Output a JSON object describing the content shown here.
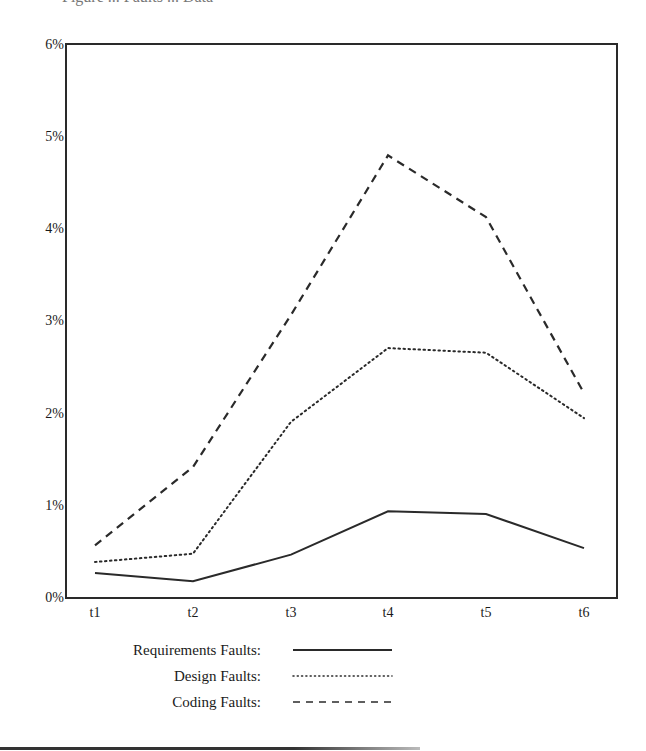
{
  "header": {
    "cutoff_title": "Figure ... Faults ... Data"
  },
  "chart_data": {
    "type": "line",
    "title": "",
    "xlabel": "",
    "ylabel": "",
    "categories": [
      "t1",
      "t2",
      "t3",
      "t4",
      "t5",
      "t6"
    ],
    "y_ticks": [
      "0%",
      "1%",
      "2%",
      "3%",
      "4%",
      "5%",
      "6%"
    ],
    "ylim": [
      0,
      6
    ],
    "grid": false,
    "legend_position": "bottom",
    "series": [
      {
        "name": "Requirements Faults:",
        "style": "solid",
        "values": [
          0.26,
          0.17,
          0.46,
          0.93,
          0.9,
          0.53
        ]
      },
      {
        "name": "Design Faults:",
        "style": "dotted",
        "values": [
          0.38,
          0.47,
          1.9,
          2.7,
          2.65,
          1.94
        ]
      },
      {
        "name": "Coding Faults:",
        "style": "dashed",
        "values": [
          0.56,
          1.41,
          3.06,
          4.79,
          4.12,
          2.21
        ]
      }
    ]
  },
  "colors": {
    "line": "#2a2a2a",
    "axis": "#2a2a2a",
    "background": "#ffffff"
  }
}
